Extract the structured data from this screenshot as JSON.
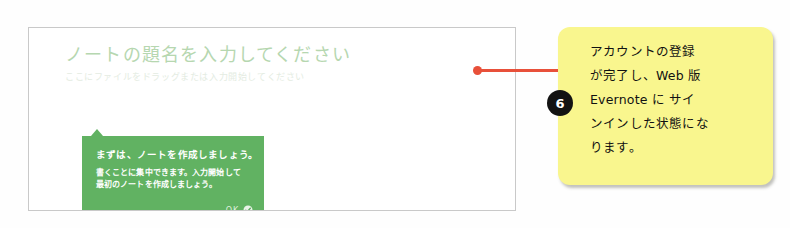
{
  "screenshot_panel": {
    "note_title": "ノートの題名を入力してください",
    "note_placeholder": "ここにファイルをドラッグまたは入力開始してください",
    "coach_tip": {
      "heading": "まずは、ノートを作成しましょう。",
      "body_line1": "書くことに集中できます。入力開始して",
      "body_line2": "最初のノートを作成しましょう。",
      "ok_label": "OK",
      "ok_icon": "check-circle-icon",
      "background_color": "#61b262"
    }
  },
  "connector": {
    "dot_icon": "anchor-dot-icon",
    "color": "#e8503a"
  },
  "callout": {
    "badge_number": "6",
    "background_color": "#f9f68e",
    "lines": [
      "アカウントの登録",
      "が完了し、Web 版",
      "Evernote に サイ",
      "ンインした状態にな",
      "ります。"
    ]
  }
}
